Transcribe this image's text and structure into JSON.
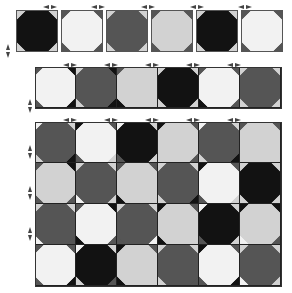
{
  "palette": {
    "B": "#121212",
    "D": "#555555",
    "L": "#d2d2d2",
    "W": "#f2f2f2"
  },
  "single_tiles": {
    "top": 10,
    "left": 16,
    "size": 42,
    "gap": 3,
    "fills": [
      "B",
      "W",
      "D",
      "L",
      "B",
      "W"
    ],
    "corners": [
      [
        "L",
        "L",
        "L",
        "L"
      ],
      [
        "D",
        "D",
        "D",
        "D"
      ],
      [
        "L",
        "L",
        "L",
        "L"
      ],
      [
        "D",
        "D",
        "D",
        "D"
      ],
      [
        "L",
        "L",
        "L",
        "L"
      ],
      [
        "D",
        "D",
        "D",
        "D"
      ]
    ]
  },
  "strip": {
    "top": 67,
    "left": 35,
    "tile": 41,
    "cols": 6,
    "fills": [
      "W",
      "D",
      "L",
      "B",
      "W",
      "D"
    ],
    "corners": [
      [
        "D",
        "B",
        "D",
        "B"
      ],
      [
        "L",
        "B",
        "L",
        "B"
      ],
      [
        "D",
        "L",
        "B",
        "L"
      ],
      [
        "L",
        "L",
        "L",
        "L"
      ],
      [
        "D",
        "D",
        "B",
        "D"
      ],
      [
        "L",
        "L",
        "L",
        "L"
      ]
    ]
  },
  "board": {
    "top": 122,
    "left": 35,
    "tile": 41,
    "cols": 6,
    "rows": 4,
    "fills": [
      [
        "D",
        "W",
        "B",
        "L",
        "D",
        "L"
      ],
      [
        "L",
        "D",
        "L",
        "D",
        "W",
        "B"
      ],
      [
        "D",
        "W",
        "D",
        "L",
        "B",
        "L"
      ],
      [
        "W",
        "B",
        "L",
        "D",
        "W",
        "D"
      ]
    ],
    "corners": [
      [
        [
          "W",
          "L",
          "L",
          "B"
        ],
        [
          "B",
          "D",
          "D",
          "L"
        ],
        [
          "W",
          "L",
          "D",
          "L"
        ],
        [
          "B",
          "D",
          "L",
          "D"
        ],
        [
          "W",
          "L",
          "L",
          "B"
        ],
        [
          "D",
          "D",
          "L",
          "L"
        ]
      ],
      [
        [
          "D",
          "B",
          "D",
          "D"
        ],
        [
          "L",
          "L",
          "W",
          "L"
        ],
        [
          "D",
          "D",
          "B",
          "L"
        ],
        [
          "L",
          "L",
          "L",
          "B"
        ],
        [
          "B",
          "D",
          "D",
          "L"
        ],
        [
          "L",
          "L",
          "L",
          "L"
        ]
      ],
      [
        [
          "L",
          "L",
          "W",
          "D"
        ],
        [
          "D",
          "B",
          "B",
          "D"
        ],
        [
          "L",
          "L",
          "D",
          "W"
        ],
        [
          "B",
          "D",
          "B",
          "L"
        ],
        [
          "W",
          "L",
          "D",
          "L"
        ],
        [
          "B",
          "B",
          "W",
          "D"
        ]
      ],
      [
        [
          "D",
          "D",
          "D",
          "B"
        ],
        [
          "W",
          "L",
          "L",
          "D"
        ],
        [
          "B",
          "D",
          "B",
          "L"
        ],
        [
          "L",
          "L",
          "L",
          "D"
        ],
        [
          "B",
          "D",
          "D",
          "B"
        ],
        [
          "L",
          "L",
          "W",
          "L"
        ]
      ]
    ]
  },
  "markers": {
    "top_arrows_x": [
      50,
      98,
      148,
      197,
      245
    ],
    "top_arrows_y": 5,
    "strip_arrows_x": [
      70,
      111,
      152,
      193,
      234
    ],
    "strip_arrows_y": 63,
    "board_arrows_x": [
      70,
      111,
      152,
      193,
      234
    ],
    "board_arrows_y": 118,
    "side_arrows_y": [
      51,
      106,
      152,
      193,
      234
    ],
    "side_arrows_x": [
      6,
      28,
      28,
      28,
      28
    ]
  }
}
